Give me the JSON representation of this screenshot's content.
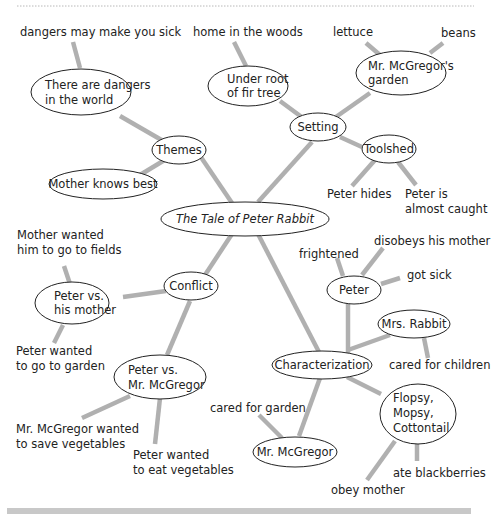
{
  "diagram": {
    "title": "The Tale of Peter Rabbit",
    "colors": {
      "edge": "#b0b0b0",
      "ellipse_stroke": "#222222",
      "text": "#222222",
      "bottom_bar": "#c8c8c8",
      "dotted_rule": "#b8b8b8"
    },
    "center": {
      "id": "center",
      "label": "The Tale of Peter Rabbit",
      "italic": true
    },
    "branches": {
      "themes": {
        "label": "Themes",
        "children": {
          "dangers": {
            "lines": [
              "There are dangers",
              "in the world"
            ],
            "detail": "dangers may make you sick"
          },
          "mother": {
            "lines": [
              "Mother knows best"
            ]
          }
        }
      },
      "setting": {
        "label": "Setting",
        "children": {
          "fir": {
            "lines": [
              "Under root",
              "of fir tree"
            ],
            "detail": "home in the woods"
          },
          "garden": {
            "lines": [
              "Mr. McGregor's",
              "garden"
            ],
            "details": [
              "lettuce",
              "beans"
            ]
          },
          "toolshed": {
            "lines": [
              "Toolshed"
            ],
            "details": [
              "Peter hides",
              [
                "Peter is",
                "almost caught"
              ]
            ]
          }
        }
      },
      "conflict": {
        "label": "Conflict",
        "children": {
          "vs_mother": {
            "lines": [
              "Peter vs.",
              "his mother"
            ],
            "details": [
              [
                "Mother wanted",
                "him to go to fields"
              ],
              [
                "Peter wanted",
                "to go to garden"
              ]
            ]
          },
          "vs_mcgregor": {
            "lines": [
              "Peter vs.",
              "Mr. McGregor"
            ],
            "details": [
              [
                "Mr. McGregor wanted",
                "to save vegetables"
              ],
              [
                "Peter wanted",
                "to eat vegetables"
              ]
            ]
          }
        }
      },
      "characterization": {
        "label": "Characterization",
        "children": {
          "peter": {
            "lines": [
              "Peter"
            ],
            "details": [
              "frightened",
              "disobeys his mother",
              "got sick"
            ]
          },
          "mrs_rabbit": {
            "lines": [
              "Mrs. Rabbit"
            ],
            "details": [
              "cared for children"
            ]
          },
          "flopsy": {
            "lines": [
              "Flopsy,",
              "Mopsy,",
              "Cottontail"
            ],
            "details": [
              "ate blackberries",
              "obey mother"
            ]
          },
          "mcgregor": {
            "lines": [
              "Mr. McGregor"
            ],
            "details": [
              "cared for garden"
            ]
          }
        }
      }
    }
  }
}
